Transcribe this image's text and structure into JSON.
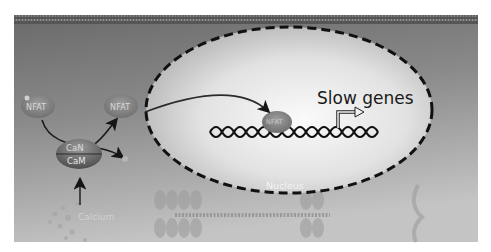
{
  "figure": {
    "labels": {
      "slow_genes": "Slow genes",
      "nucleus": "Nucleus",
      "calcium": "Calcium",
      "calcineurin": "CaN",
      "calmodulin": "CaM",
      "nfat_cytoplasm_1": "NFAT",
      "nfat_cytoplasm_2": "NFAT",
      "nfat_nuclear": "NFAT"
    },
    "colors": {
      "cytoplasm_dark": "#6e6e6e",
      "cytoplasm_light": "#bdbdbd",
      "nucleus_center": "#f6f6f6",
      "nucleus_edge": "#bcbcbc",
      "membrane": "#4a4a4a",
      "dna": "#111111",
      "nfat_fill": "#8a8a8a",
      "can_cam_fill": "#6b6b6b",
      "arrow": "#1a1a1a",
      "sarcomere": "#a8a8a8"
    }
  }
}
